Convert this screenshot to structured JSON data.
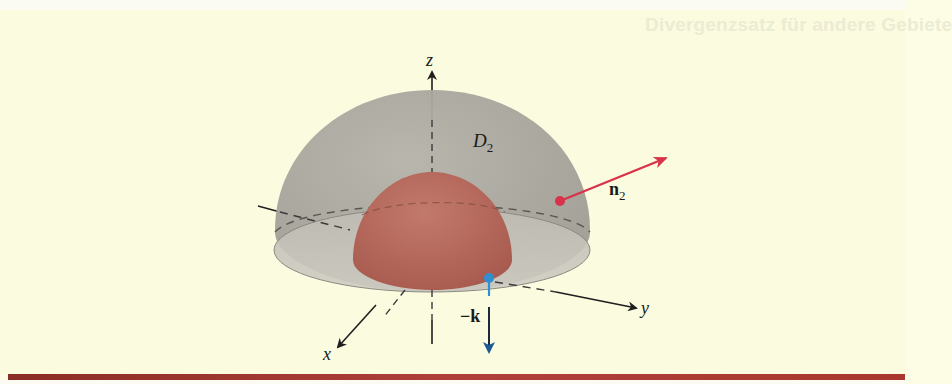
{
  "page": {
    "ghost_header": "Divergenzsatz für andere Gebiete"
  },
  "figure": {
    "axes": {
      "z_label": "z",
      "y_label": "y",
      "x_label": "x"
    },
    "region_label": {
      "main": "D",
      "subscript": "2"
    },
    "vectors": {
      "n2": {
        "main": "n",
        "subscript": "2",
        "color": "#d8334a"
      },
      "neg_k": {
        "label": "−k",
        "color": "#2f8fd0",
        "arrow_color": "#1b5a94"
      }
    },
    "colors": {
      "outer_hemisphere": "#a9a69e",
      "inner_hemisphere": "#b86a5e",
      "base_disk": "#c7c4ba",
      "background": "#fbfbdf",
      "rule": "#a3352d"
    }
  }
}
